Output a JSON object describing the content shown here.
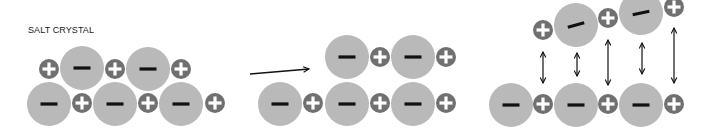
{
  "title": "SALT CRYSTAL",
  "colors": {
    "anion_fill": "#b9b9b9",
    "cation_fill": "#707070",
    "anion_sign": "#111111",
    "cation_sign": "#ffffff",
    "arrow": "#111111",
    "background": "#ffffff"
  },
  "sizes": {
    "anion_radius": 22,
    "cation_radius": 10
  },
  "panels": [
    {
      "name": "crystal",
      "ions": [
        {
          "type": "cation",
          "x": 49,
          "y": 69
        },
        {
          "type": "anion",
          "x": 82,
          "y": 68
        },
        {
          "type": "cation",
          "x": 115,
          "y": 69
        },
        {
          "type": "anion",
          "x": 148,
          "y": 69
        },
        {
          "type": "cation",
          "x": 181,
          "y": 69
        },
        {
          "type": "anion",
          "x": 49,
          "y": 104
        },
        {
          "type": "cation",
          "x": 82,
          "y": 103
        },
        {
          "type": "anion",
          "x": 115,
          "y": 104
        },
        {
          "type": "cation",
          "x": 148,
          "y": 103
        },
        {
          "type": "anion",
          "x": 181,
          "y": 104
        },
        {
          "type": "cation",
          "x": 215,
          "y": 103
        }
      ]
    },
    {
      "name": "shifted-layer",
      "ions": [
        {
          "type": "anion",
          "x": 347,
          "y": 57
        },
        {
          "type": "cation",
          "x": 380,
          "y": 57
        },
        {
          "type": "anion",
          "x": 413,
          "y": 57
        },
        {
          "type": "cation",
          "x": 446,
          "y": 57
        },
        {
          "type": "anion",
          "x": 280,
          "y": 104
        },
        {
          "type": "cation",
          "x": 313,
          "y": 103
        },
        {
          "type": "anion",
          "x": 347,
          "y": 104
        },
        {
          "type": "cation",
          "x": 380,
          "y": 103
        },
        {
          "type": "anion",
          "x": 413,
          "y": 104
        },
        {
          "type": "cation",
          "x": 446,
          "y": 103
        }
      ]
    },
    {
      "name": "repulsion",
      "ions": [
        {
          "type": "cation",
          "x": 543,
          "y": 30
        },
        {
          "type": "anion",
          "x": 576,
          "y": 25,
          "rotate": -15
        },
        {
          "type": "cation",
          "x": 608,
          "y": 18
        },
        {
          "type": "anion",
          "x": 641,
          "y": 13,
          "rotate": -12
        },
        {
          "type": "cation",
          "x": 674,
          "y": 7
        },
        {
          "type": "anion",
          "x": 511,
          "y": 105
        },
        {
          "type": "cation",
          "x": 543,
          "y": 104
        },
        {
          "type": "anion",
          "x": 576,
          "y": 105
        },
        {
          "type": "cation",
          "x": 608,
          "y": 104
        },
        {
          "type": "anion",
          "x": 641,
          "y": 105
        },
        {
          "type": "cation",
          "x": 674,
          "y": 104
        }
      ]
    }
  ],
  "transition_arrow": {
    "x1": 250,
    "y1": 74,
    "x2": 309,
    "y2": 69
  },
  "repulsion_arrows": [
    {
      "x": 543,
      "y1": 52,
      "y2": 83
    },
    {
      "x": 577,
      "y1": 53,
      "y2": 76
    },
    {
      "x": 608,
      "y1": 40,
      "y2": 85
    },
    {
      "x": 642,
      "y1": 43,
      "y2": 74
    },
    {
      "x": 674,
      "y1": 28,
      "y2": 83
    }
  ]
}
